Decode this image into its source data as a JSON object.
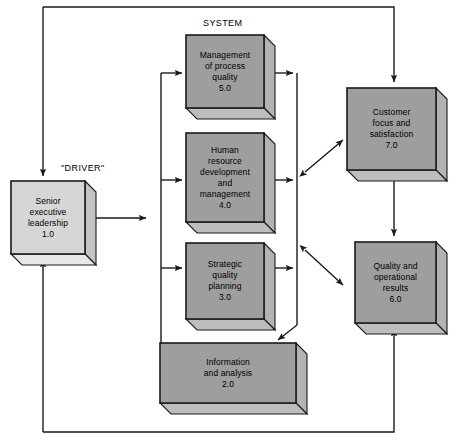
{
  "diagram": {
    "title": "SYSTEM",
    "captions": [
      {
        "name": "system-caption",
        "text": "SYSTEM",
        "x": 203,
        "y": 18
      },
      {
        "name": "driver-caption",
        "text": "\"DRIVER\"",
        "x": 61,
        "y": 163
      }
    ],
    "colors": {
      "box_face_gray": "#9e9e9e",
      "box_face_light": "#d6d6d6",
      "box_top_shade": "#bdbdbd",
      "box_side_shade": "#b3b3b3",
      "box_top_shade_light": "#e8e8e8",
      "box_side_shade_light": "#c4c4c4",
      "outline": "#1a1a1a",
      "line": "#1a1a1a",
      "text": "#000000",
      "background": "#ffffff"
    },
    "nodes": [
      {
        "name": "node-management-of-process-quality",
        "id": "5.0",
        "lines": [
          "Management",
          "of process",
          "quality",
          "5.0"
        ],
        "face": {
          "x": 186,
          "y": 35,
          "w": 78,
          "h": 73
        },
        "depth": 11,
        "shade": "dark"
      },
      {
        "name": "node-human-resource-development-and-management",
        "id": "4.0",
        "lines": [
          "Human",
          "resource",
          "development",
          "and",
          "management",
          "4.0"
        ],
        "face": {
          "x": 186,
          "y": 133,
          "w": 78,
          "h": 89
        },
        "depth": 11,
        "shade": "dark"
      },
      {
        "name": "node-strategic-quality-planning",
        "id": "3.0",
        "lines": [
          "Strategic",
          "quality",
          "planning",
          "3.0"
        ],
        "face": {
          "x": 186,
          "y": 243,
          "w": 78,
          "h": 76
        },
        "depth": 11,
        "shade": "dark"
      },
      {
        "name": "node-information-and-analysis",
        "id": "2.0",
        "lines": [
          "Information",
          "and analysis",
          "2.0"
        ],
        "face": {
          "x": 160,
          "y": 343,
          "w": 136,
          "h": 60
        },
        "depth": 11,
        "shade": "dark"
      },
      {
        "name": "node-senior-executive-leadership",
        "id": "1.0",
        "lines": [
          "Senior",
          "executive",
          "leadership",
          "1.0"
        ],
        "face": {
          "x": 11,
          "y": 181,
          "w": 74,
          "h": 73
        },
        "depth": 11,
        "shade": "light"
      },
      {
        "name": "node-customer-focus-and-satisfaction",
        "id": "7.0",
        "lines": [
          "Customer",
          "focus and",
          "satisfaction",
          "7.0"
        ],
        "face": {
          "x": 347,
          "y": 88,
          "w": 89,
          "h": 82
        },
        "depth": 11,
        "shade": "dark"
      },
      {
        "name": "node-quality-and-operational-results",
        "id": "6.0",
        "lines": [
          "Quality and",
          "operational",
          "results",
          "6.0"
        ],
        "face": {
          "x": 355,
          "y": 242,
          "w": 81,
          "h": 81
        },
        "depth": 11,
        "shade": "dark"
      }
    ],
    "connectors": [
      {
        "name": "connector-feedback-top-customer",
        "points": "43,7 394,7 394,82",
        "arrow_end": true,
        "arrow_start": false
      },
      {
        "name": "connector-feedback-bottom-quality",
        "points": "43,432 394,432 394,329",
        "arrow_end": true,
        "arrow_start": false
      },
      {
        "name": "connector-left-rail-down",
        "points": "43,7 43,176",
        "arrow_end": true,
        "arrow_start": false
      },
      {
        "name": "connector-left-rail-up",
        "points": "43,432 43,260",
        "arrow_end": true,
        "arrow_start": false
      },
      {
        "name": "connector-driver-to-system",
        "points": "96,218 146,218",
        "arrow_end": true,
        "arrow_start": true
      },
      {
        "name": "connector-system-left-rail",
        "points": "161,73 161,345",
        "arrow_end": false,
        "arrow_start": false
      },
      {
        "name": "connector-into-process-quality",
        "points": "161,73 182,73",
        "arrow_end": true,
        "arrow_start": false
      },
      {
        "name": "connector-into-human-resource",
        "points": "161,180 182,180",
        "arrow_end": true,
        "arrow_start": false
      },
      {
        "name": "connector-into-strategic-planning",
        "points": "161,268 182,268",
        "arrow_end": true,
        "arrow_start": false
      },
      {
        "name": "connector-system-left-rail-foot",
        "points": "161,345 172,345",
        "arrow_end": false,
        "arrow_start": false
      },
      {
        "name": "connector-system-right-rail",
        "points": "297,73 297,325",
        "arrow_end": false,
        "arrow_start": false
      },
      {
        "name": "connector-out-process-quality",
        "points": "267,73 293,73",
        "arrow_end": true,
        "arrow_start": false
      },
      {
        "name": "connector-out-human-resource",
        "points": "267,180 293,180",
        "arrow_end": true,
        "arrow_start": false
      },
      {
        "name": "connector-out-strategic-planning",
        "points": "267,268 293,268",
        "arrow_end": true,
        "arrow_start": false
      },
      {
        "name": "connector-right-rail-to-information",
        "points": "297,325 278,340",
        "arrow_end": true,
        "arrow_start": false
      },
      {
        "name": "connector-system-to-customer",
        "points": "305,172 343,140",
        "arrow_end": true,
        "arrow_start": true
      },
      {
        "name": "connector-system-to-quality-results",
        "points": "305,250 343,285",
        "arrow_end": true,
        "arrow_start": true
      },
      {
        "name": "connector-customer-to-quality-results",
        "points": "394,178 394,236",
        "arrow_end": true,
        "arrow_start": true
      }
    ]
  }
}
